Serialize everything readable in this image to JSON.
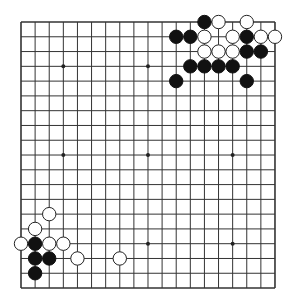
{
  "board": {
    "size": 19,
    "origin_x": 21,
    "origin_y": 22,
    "spacing_x": 14.11,
    "spacing_y": 14.78,
    "line_color": "#333333",
    "background": "#ffffff",
    "star_points": [
      [
        3,
        3
      ],
      [
        9,
        3
      ],
      [
        15,
        3
      ],
      [
        3,
        9
      ],
      [
        9,
        9
      ],
      [
        15,
        9
      ],
      [
        3,
        15
      ],
      [
        9,
        15
      ],
      [
        15,
        15
      ]
    ],
    "stones": [
      {
        "color": "black",
        "col": 13,
        "row": 0
      },
      {
        "color": "white",
        "col": 14,
        "row": 0
      },
      {
        "color": "white",
        "col": 16,
        "row": 0
      },
      {
        "color": "black",
        "col": 11,
        "row": 1
      },
      {
        "color": "black",
        "col": 12,
        "row": 1
      },
      {
        "color": "white",
        "col": 13,
        "row": 1
      },
      {
        "color": "white",
        "col": 15,
        "row": 1
      },
      {
        "color": "black",
        "col": 16,
        "row": 1
      },
      {
        "color": "white",
        "col": 17,
        "row": 1
      },
      {
        "color": "white",
        "col": 18,
        "row": 1
      },
      {
        "color": "white",
        "col": 13,
        "row": 2
      },
      {
        "color": "white",
        "col": 14,
        "row": 2
      },
      {
        "color": "white",
        "col": 15,
        "row": 2
      },
      {
        "color": "black",
        "col": 16,
        "row": 2
      },
      {
        "color": "black",
        "col": 17,
        "row": 2
      },
      {
        "color": "black",
        "col": 12,
        "row": 3
      },
      {
        "color": "black",
        "col": 13,
        "row": 3
      },
      {
        "color": "black",
        "col": 14,
        "row": 3
      },
      {
        "color": "black",
        "col": 15,
        "row": 3
      },
      {
        "color": "black",
        "col": 11,
        "row": 4
      },
      {
        "color": "black",
        "col": 16,
        "row": 4
      },
      {
        "color": "white",
        "col": 2,
        "row": 13
      },
      {
        "color": "white",
        "col": 1,
        "row": 14
      },
      {
        "color": "white",
        "col": 0,
        "row": 15
      },
      {
        "color": "black",
        "col": 1,
        "row": 15
      },
      {
        "color": "white",
        "col": 2,
        "row": 15
      },
      {
        "color": "white",
        "col": 3,
        "row": 15
      },
      {
        "color": "black",
        "col": 1,
        "row": 16
      },
      {
        "color": "black",
        "col": 2,
        "row": 16
      },
      {
        "color": "white",
        "col": 4,
        "row": 16
      },
      {
        "color": "white",
        "col": 7,
        "row": 16
      },
      {
        "color": "black",
        "col": 1,
        "row": 17
      }
    ]
  }
}
